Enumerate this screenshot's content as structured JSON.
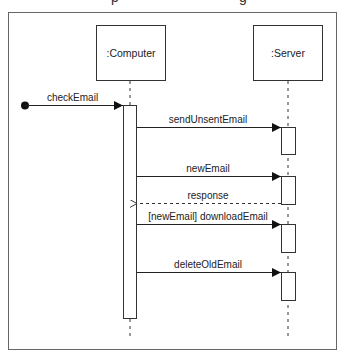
{
  "diagram": {
    "type": "UML sequence diagram",
    "title_fragment": "p      g",
    "colors": {
      "line": "#222222",
      "frame": "#666666",
      "box_fill": "#ffffff",
      "box_stroke": "#333333"
    },
    "lifelines": [
      {
        "id": "computer",
        "label": ":Computer"
      },
      {
        "id": "server",
        "label": ":Server"
      }
    ],
    "found_message": {
      "label": "checkEmail",
      "to": "computer"
    },
    "messages": [
      {
        "label": "sendUnsentEmail",
        "from": "computer",
        "to": "server",
        "kind": "sync"
      },
      {
        "label": "newEmail",
        "from": "computer",
        "to": "server",
        "kind": "sync"
      },
      {
        "label": "response",
        "from": "server",
        "to": "computer",
        "kind": "return"
      },
      {
        "label": "[newEmail] downloadEmail",
        "from": "computer",
        "to": "server",
        "kind": "sync"
      },
      {
        "label": "deleteOldEmail",
        "from": "computer",
        "to": "server",
        "kind": "sync"
      }
    ]
  }
}
